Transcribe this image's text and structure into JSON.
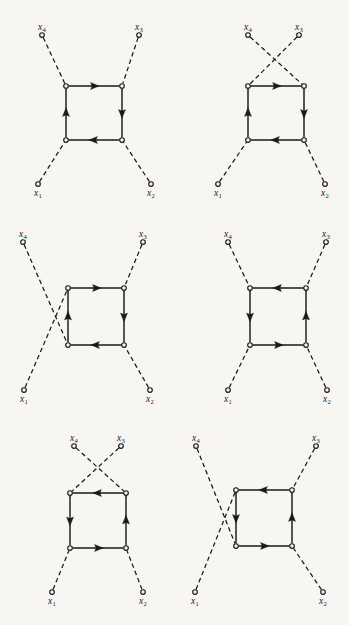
{
  "figure": {
    "background_color": "#f7f6f3",
    "ink_color": "#1a1a1a",
    "line_style_internal": "solid",
    "line_style_external": "dashed",
    "vertex_marker": "open-circle",
    "columns": 2,
    "rows": 3
  },
  "labels": {
    "x1": "x",
    "x2": "x",
    "x3": "x",
    "x4": "x",
    "sub1": "1",
    "sub2": "2",
    "sub3": "3",
    "sub4": "4"
  },
  "diagrams": [
    {
      "id": "diagram-1",
      "position": "top-left",
      "loop_direction": "clockwise",
      "external_legs_crossed": "none",
      "square": {
        "left": 66,
        "right": 122,
        "top": 86,
        "bottom": 140
      },
      "legs": [
        {
          "name": "x1",
          "endpoint": [
            38,
            184
          ],
          "vertex": "bottom-left",
          "label_pos": "below"
        },
        {
          "name": "x2",
          "endpoint": [
            151,
            184
          ],
          "vertex": "bottom-right",
          "label_pos": "below"
        },
        {
          "name": "x3",
          "endpoint": [
            139,
            35
          ],
          "vertex": "top-right",
          "label_pos": "above"
        },
        {
          "name": "x4",
          "endpoint": [
            42,
            35
          ],
          "vertex": "top-left",
          "label_pos": "above"
        }
      ],
      "arrows": [
        {
          "edge": "top",
          "direction": "right"
        },
        {
          "edge": "right",
          "direction": "down"
        },
        {
          "edge": "bottom",
          "direction": "left"
        },
        {
          "edge": "left",
          "direction": "up"
        }
      ]
    },
    {
      "id": "diagram-2",
      "position": "top-right",
      "loop_direction": "clockwise",
      "external_legs_crossed": "top",
      "square": {
        "left": 248,
        "right": 304,
        "top": 86,
        "bottom": 140
      },
      "legs": [
        {
          "name": "x1",
          "endpoint": [
            218,
            184
          ],
          "vertex": "bottom-left",
          "label_pos": "below"
        },
        {
          "name": "x2",
          "endpoint": [
            325,
            184
          ],
          "vertex": "bottom-right",
          "label_pos": "below"
        },
        {
          "name": "x3",
          "endpoint": [
            299,
            35
          ],
          "vertex": "top-left",
          "label_pos": "above"
        },
        {
          "name": "x4",
          "endpoint": [
            248,
            35
          ],
          "vertex": "top-right",
          "label_pos": "above"
        }
      ],
      "arrows": [
        {
          "edge": "top",
          "direction": "right"
        },
        {
          "edge": "right",
          "direction": "down"
        },
        {
          "edge": "bottom",
          "direction": "left"
        },
        {
          "edge": "left",
          "direction": "up"
        }
      ]
    },
    {
      "id": "diagram-3",
      "position": "middle-left",
      "loop_direction": "clockwise",
      "external_legs_crossed": "left",
      "square": {
        "left": 68,
        "right": 124,
        "top": 288,
        "bottom": 345
      },
      "legs": [
        {
          "name": "x1",
          "endpoint": [
            24,
            390
          ],
          "vertex": "top-left",
          "label_pos": "below"
        },
        {
          "name": "x2",
          "endpoint": [
            150,
            390
          ],
          "vertex": "bottom-right",
          "label_pos": "below"
        },
        {
          "name": "x3",
          "endpoint": [
            143,
            242
          ],
          "vertex": "top-right",
          "label_pos": "above"
        },
        {
          "name": "x4",
          "endpoint": [
            23,
            242
          ],
          "vertex": "bottom-left",
          "label_pos": "above"
        }
      ],
      "arrows": [
        {
          "edge": "top",
          "direction": "right"
        },
        {
          "edge": "right",
          "direction": "down"
        },
        {
          "edge": "bottom",
          "direction": "left"
        },
        {
          "edge": "left",
          "direction": "up"
        }
      ]
    },
    {
      "id": "diagram-4",
      "position": "middle-right",
      "loop_direction": "counter-clockwise",
      "external_legs_crossed": "none",
      "square": {
        "left": 250,
        "right": 306,
        "top": 288,
        "bottom": 345
      },
      "legs": [
        {
          "name": "x1",
          "endpoint": [
            228,
            390
          ],
          "vertex": "bottom-left",
          "label_pos": "below"
        },
        {
          "name": "x2",
          "endpoint": [
            327,
            390
          ],
          "vertex": "bottom-right",
          "label_pos": "below"
        },
        {
          "name": "x3",
          "endpoint": [
            326,
            242
          ],
          "vertex": "top-right",
          "label_pos": "above"
        },
        {
          "name": "x4",
          "endpoint": [
            228,
            242
          ],
          "vertex": "top-left",
          "label_pos": "above"
        }
      ],
      "arrows": [
        {
          "edge": "top",
          "direction": "left"
        },
        {
          "edge": "right",
          "direction": "up"
        },
        {
          "edge": "bottom",
          "direction": "right"
        },
        {
          "edge": "left",
          "direction": "down"
        }
      ]
    },
    {
      "id": "diagram-5",
      "position": "bottom-left",
      "loop_direction": "counter-clockwise",
      "external_legs_crossed": "top",
      "square": {
        "left": 70,
        "right": 126,
        "top": 493,
        "bottom": 548
      },
      "legs": [
        {
          "name": "x1",
          "endpoint": [
            52,
            592
          ],
          "vertex": "bottom-left",
          "label_pos": "below"
        },
        {
          "name": "x2",
          "endpoint": [
            143,
            592
          ],
          "vertex": "bottom-right",
          "label_pos": "below"
        },
        {
          "name": "x3",
          "endpoint": [
            121,
            446
          ],
          "vertex": "top-left",
          "label_pos": "above"
        },
        {
          "name": "x4",
          "endpoint": [
            74,
            446
          ],
          "vertex": "top-right",
          "label_pos": "above"
        }
      ],
      "arrows": [
        {
          "edge": "top",
          "direction": "left"
        },
        {
          "edge": "right",
          "direction": "up"
        },
        {
          "edge": "bottom",
          "direction": "right"
        },
        {
          "edge": "left",
          "direction": "down"
        }
      ]
    },
    {
      "id": "diagram-6",
      "position": "bottom-right",
      "loop_direction": "counter-clockwise",
      "external_legs_crossed": "left",
      "square": {
        "left": 236,
        "right": 292,
        "top": 490,
        "bottom": 546
      },
      "legs": [
        {
          "name": "x1",
          "endpoint": [
            195,
            592
          ],
          "vertex": "top-left",
          "label_pos": "below"
        },
        {
          "name": "x2",
          "endpoint": [
            323,
            592
          ],
          "vertex": "bottom-right",
          "label_pos": "below"
        },
        {
          "name": "x3",
          "endpoint": [
            316,
            446
          ],
          "vertex": "top-right",
          "label_pos": "above"
        },
        {
          "name": "x4",
          "endpoint": [
            196,
            446
          ],
          "vertex": "bottom-left",
          "label_pos": "above"
        }
      ],
      "arrows": [
        {
          "edge": "top",
          "direction": "left"
        },
        {
          "edge": "right",
          "direction": "up"
        },
        {
          "edge": "bottom",
          "direction": "right"
        },
        {
          "edge": "left",
          "direction": "down"
        }
      ]
    }
  ]
}
